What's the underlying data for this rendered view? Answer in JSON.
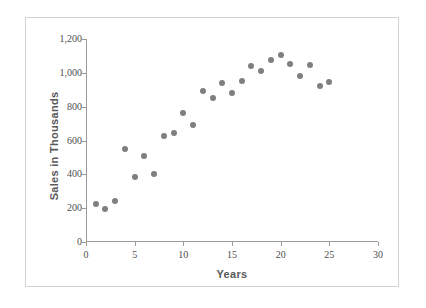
{
  "chart_data": {
    "type": "scatter",
    "title": "",
    "xlabel": "Years",
    "ylabel": "Sales in Thousands",
    "xlim": [
      0,
      30
    ],
    "ylim": [
      0,
      1200
    ],
    "grid": false,
    "legend": "none",
    "marker_color": "#7f7f7f",
    "axis_color": "#9a9a9a",
    "xticks": [
      0,
      5,
      10,
      15,
      20,
      25,
      30
    ],
    "xtick_labels": [
      "0",
      "5",
      "10",
      "15",
      "20",
      "25",
      "30"
    ],
    "yticks": [
      0,
      200,
      400,
      600,
      800,
      1000,
      1200
    ],
    "ytick_labels": [
      "0",
      "200",
      "400",
      "600",
      "800",
      "1,000",
      "1,200"
    ],
    "x": [
      1,
      2,
      3,
      4,
      5,
      6,
      7,
      8,
      9,
      10,
      11,
      12,
      13,
      14,
      15,
      16,
      17,
      18,
      19,
      20,
      21,
      22,
      23,
      24,
      25
    ],
    "y": [
      225,
      195,
      240,
      550,
      385,
      510,
      400,
      625,
      645,
      760,
      690,
      890,
      850,
      940,
      880,
      950,
      1040,
      1010,
      1075,
      1105,
      1050,
      980,
      1045,
      920,
      945
    ],
    "points": [
      {
        "x": 1,
        "y": 225
      },
      {
        "x": 2,
        "y": 195
      },
      {
        "x": 3,
        "y": 240
      },
      {
        "x": 4,
        "y": 550
      },
      {
        "x": 5,
        "y": 385
      },
      {
        "x": 6,
        "y": 510
      },
      {
        "x": 7,
        "y": 400
      },
      {
        "x": 8,
        "y": 625
      },
      {
        "x": 9,
        "y": 645
      },
      {
        "x": 10,
        "y": 760
      },
      {
        "x": 11,
        "y": 690
      },
      {
        "x": 12,
        "y": 890
      },
      {
        "x": 13,
        "y": 850
      },
      {
        "x": 14,
        "y": 940
      },
      {
        "x": 15,
        "y": 880
      },
      {
        "x": 16,
        "y": 950
      },
      {
        "x": 17,
        "y": 1040
      },
      {
        "x": 18,
        "y": 1010
      },
      {
        "x": 19,
        "y": 1075
      },
      {
        "x": 20,
        "y": 1105
      },
      {
        "x": 21,
        "y": 1050
      },
      {
        "x": 22,
        "y": 980
      },
      {
        "x": 23,
        "y": 1045
      },
      {
        "x": 24,
        "y": 920
      },
      {
        "x": 25,
        "y": 945
      }
    ]
  }
}
